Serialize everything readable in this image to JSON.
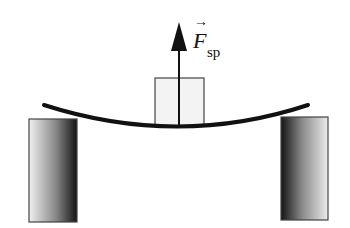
{
  "diagram": {
    "force_label": {
      "symbol": "F",
      "subscript": "sp",
      "vector_arrow": "→"
    },
    "elements": [
      "left-support",
      "right-support",
      "bent-beam",
      "block",
      "force-arrow"
    ],
    "colors": {
      "beam": "#111111",
      "block_fill": "#f2f2f2",
      "block_stroke": "#444444",
      "support_dark": "#1a1a1a",
      "support_light": "#e8e8e8"
    }
  }
}
